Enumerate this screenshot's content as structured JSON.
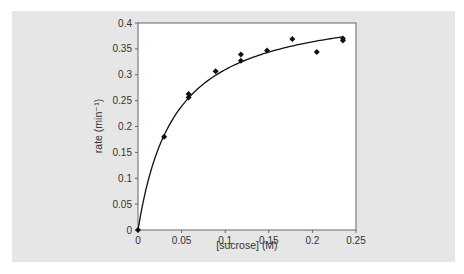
{
  "chart_data": {
    "type": "scatter",
    "title": "",
    "xlabel": "[sucrose] (M)",
    "ylabel": "rate (min⁻¹)",
    "xlim": [
      0,
      0.25
    ],
    "ylim": [
      0,
      0.4
    ],
    "x_ticks": [
      "0",
      "0.05",
      "0.1",
      "0.15",
      "0.2",
      "0.25"
    ],
    "y_ticks": [
      "0",
      "0.05",
      "0.1",
      "0.15",
      "0.2",
      "0.25",
      "0.3",
      "0.35",
      "0.4"
    ],
    "grid": false,
    "legend": null,
    "series": [
      {
        "name": "measured rate",
        "marker": "diamond",
        "points": [
          {
            "x": 0.0,
            "y": 0.0
          },
          {
            "x": 0.03,
            "y": 0.18
          },
          {
            "x": 0.058,
            "y": 0.263
          },
          {
            "x": 0.058,
            "y": 0.256
          },
          {
            "x": 0.089,
            "y": 0.307
          },
          {
            "x": 0.118,
            "y": 0.339
          },
          {
            "x": 0.118,
            "y": 0.327
          },
          {
            "x": 0.148,
            "y": 0.347
          },
          {
            "x": 0.177,
            "y": 0.369
          },
          {
            "x": 0.205,
            "y": 0.344
          },
          {
            "x": 0.235,
            "y": 0.37
          },
          {
            "x": 0.235,
            "y": 0.366
          }
        ]
      },
      {
        "name": "fitted curve",
        "type": "line",
        "model": "Michaelis-Menten",
        "vmax": 0.44,
        "km": 0.042,
        "x_range": [
          0,
          0.235
        ]
      }
    ]
  },
  "colors": {
    "panel_background": "#e6e6e6",
    "plot_background": "#ffffff",
    "axis": "#555555",
    "data": "#111111"
  }
}
